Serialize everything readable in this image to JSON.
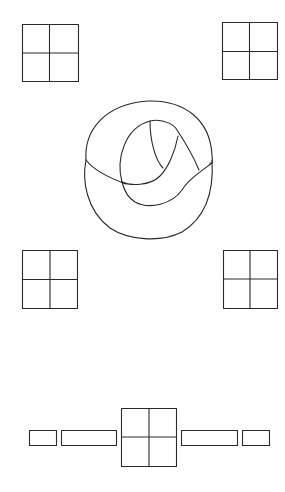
{
  "figure": {
    "background": "#ffffff",
    "stroke_color": "#2a2a2a",
    "grids": [
      {
        "id": "top-left",
        "x": 22,
        "y": 24,
        "w": 57,
        "h": 57
      },
      {
        "id": "top-right",
        "x": 222,
        "y": 22,
        "w": 55,
        "h": 57
      },
      {
        "id": "middle-left",
        "x": 22,
        "y": 250,
        "w": 56,
        "h": 58
      },
      {
        "id": "middle-right",
        "x": 223,
        "y": 250,
        "w": 54,
        "h": 58
      },
      {
        "id": "bottom-center",
        "x": 121,
        "y": 408,
        "w": 56,
        "h": 58
      }
    ],
    "bottom_bars": [
      {
        "id": "bar-far-left",
        "x": 29,
        "y": 430,
        "w": 27,
        "h": 15
      },
      {
        "id": "bar-left",
        "x": 61,
        "y": 430,
        "w": 55,
        "h": 15
      },
      {
        "id": "bar-right",
        "x": 181,
        "y": 430,
        "w": 56,
        "h": 15
      },
      {
        "id": "bar-far-right",
        "x": 242,
        "y": 430,
        "w": 27,
        "h": 15
      }
    ]
  }
}
